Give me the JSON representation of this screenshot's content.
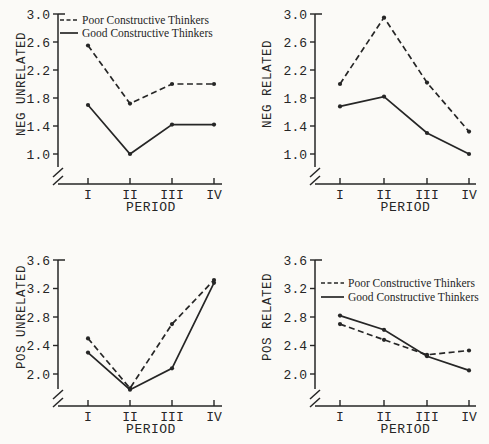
{
  "page": {
    "background_color": "#fbfaf7",
    "ink_color": "#262626"
  },
  "chart_data": [
    {
      "type": "line",
      "position": "top-left",
      "ylabel": "NEG UNRELATED",
      "xlabel": "PERIOD",
      "categories": [
        "I",
        "II",
        "III",
        "IV"
      ],
      "yticks": [
        1.0,
        1.4,
        1.8,
        2.2,
        2.6,
        3.0
      ],
      "ylim": [
        1.0,
        3.0
      ],
      "y_axis_break": true,
      "grid": false,
      "show_legend": true,
      "legend_position": "top-left-inside",
      "series": [
        {
          "name": "Poor Constructive Thinkers",
          "line_style": "dashed",
          "values": [
            2.55,
            1.72,
            2.0,
            2.0
          ]
        },
        {
          "name": "Good Constructive Thinkers",
          "line_style": "solid",
          "values": [
            1.7,
            1.0,
            1.42,
            1.42
          ]
        }
      ]
    },
    {
      "type": "line",
      "position": "top-right",
      "ylabel": "NEG RELATED",
      "xlabel": "PERIOD",
      "categories": [
        "I",
        "II",
        "III",
        "IV"
      ],
      "yticks": [
        1.0,
        1.4,
        1.8,
        2.2,
        2.6,
        3.0
      ],
      "ylim": [
        1.0,
        3.0
      ],
      "y_axis_break": true,
      "grid": false,
      "show_legend": false,
      "series": [
        {
          "name": "Poor Constructive Thinkers",
          "line_style": "dashed",
          "values": [
            2.0,
            2.95,
            2.02,
            1.32
          ]
        },
        {
          "name": "Good Constructive Thinkers",
          "line_style": "solid",
          "values": [
            1.68,
            1.82,
            1.3,
            1.0
          ]
        }
      ]
    },
    {
      "type": "line",
      "position": "bottom-left",
      "ylabel": "POS UNRELATED",
      "xlabel": "PERIOD",
      "categories": [
        "I",
        "II",
        "III",
        "IV"
      ],
      "yticks": [
        2.0,
        2.4,
        2.8,
        3.2,
        3.6
      ],
      "ylim": [
        2.0,
        3.6
      ],
      "y_axis_break": true,
      "grid": false,
      "show_legend": false,
      "series": [
        {
          "name": "Poor Constructive Thinkers",
          "line_style": "dashed",
          "values": [
            2.5,
            1.8,
            2.7,
            3.32
          ]
        },
        {
          "name": "Good Constructive Thinkers",
          "line_style": "solid",
          "values": [
            2.3,
            1.78,
            2.08,
            3.28
          ]
        }
      ]
    },
    {
      "type": "line",
      "position": "bottom-right",
      "ylabel": "POS RELATED",
      "xlabel": "PERIOD",
      "categories": [
        "I",
        "II",
        "III",
        "IV"
      ],
      "yticks": [
        2.0,
        2.4,
        2.8,
        3.2,
        3.6
      ],
      "ylim": [
        2.0,
        3.6
      ],
      "y_axis_break": true,
      "grid": false,
      "show_legend": true,
      "legend_position": "top-left-inside",
      "series": [
        {
          "name": "Poor Constructive Thinkers",
          "line_style": "dashed",
          "values": [
            2.7,
            2.48,
            2.27,
            2.33
          ]
        },
        {
          "name": "Good Constructive Thinkers",
          "line_style": "solid",
          "values": [
            2.82,
            2.62,
            2.25,
            2.05
          ]
        }
      ]
    }
  ]
}
